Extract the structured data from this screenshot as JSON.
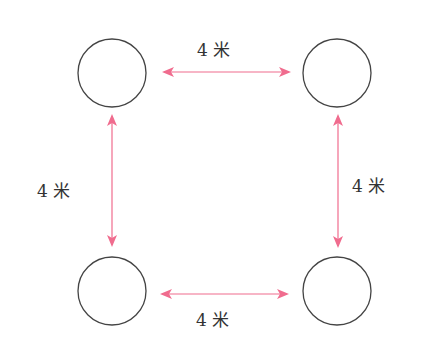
{
  "diagram": {
    "title": "",
    "nodes": [
      {
        "id": "top-left",
        "cx": 112,
        "cy": 73
      },
      {
        "id": "top-right",
        "cx": 337,
        "cy": 73
      },
      {
        "id": "bottom-left",
        "cx": 112,
        "cy": 291
      },
      {
        "id": "bottom-right",
        "cx": 337,
        "cy": 291
      }
    ],
    "edges": [
      {
        "from": "top-left",
        "to": "top-right",
        "label": "4 米"
      },
      {
        "from": "top-left",
        "to": "bottom-left",
        "label": "4 米"
      },
      {
        "from": "top-right",
        "to": "bottom-right",
        "label": "4 米"
      },
      {
        "from": "bottom-left",
        "to": "bottom-right",
        "label": "4 米"
      }
    ],
    "colors": {
      "arrow": "#f06c8e",
      "circle": "#444444"
    }
  }
}
